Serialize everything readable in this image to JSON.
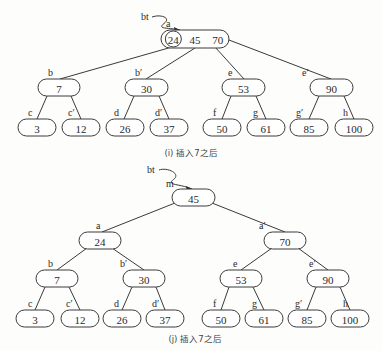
{
  "diagrams": [
    {
      "id": "i",
      "caption": "(i) 插入7之后",
      "pointer": {
        "label": "bt",
        "from": [
          152,
          17
        ],
        "to": [
          180,
          30
        ],
        "label_pos": [
          141,
          20
        ]
      },
      "nodes": [
        {
          "id": "a",
          "label": "a",
          "keys": "24  45  70",
          "x": 161,
          "y": 30,
          "w": 68,
          "h": 18,
          "lx": 166,
          "ly": 27,
          "circled_key": "24"
        },
        {
          "id": "b",
          "label": "b",
          "keys": "7",
          "x": 38,
          "y": 79,
          "w": 42,
          "h": 17,
          "lx": 48,
          "ly": 76
        },
        {
          "id": "b2",
          "label": "b′",
          "keys": "30",
          "x": 125,
          "y": 79,
          "w": 43,
          "h": 17,
          "lx": 135,
          "ly": 76
        },
        {
          "id": "e",
          "label": "e",
          "keys": "53",
          "x": 222,
          "y": 79,
          "w": 43,
          "h": 17,
          "lx": 228,
          "ly": 76
        },
        {
          "id": "e2",
          "label": "e′",
          "keys": "90",
          "x": 310,
          "y": 79,
          "w": 43,
          "h": 17,
          "lx": 302,
          "ly": 76
        },
        {
          "id": "c",
          "label": "c",
          "keys": "3",
          "x": 18,
          "y": 119,
          "w": 38,
          "h": 17,
          "lx": 28,
          "ly": 116
        },
        {
          "id": "c2",
          "label": "c′",
          "keys": "12",
          "x": 62,
          "y": 119,
          "w": 38,
          "h": 17,
          "lx": 68,
          "ly": 116
        },
        {
          "id": "d",
          "label": "d",
          "keys": "26",
          "x": 106,
          "y": 119,
          "w": 38,
          "h": 17,
          "lx": 114,
          "ly": 116
        },
        {
          "id": "d2",
          "label": "d′",
          "keys": "37",
          "x": 150,
          "y": 119,
          "w": 38,
          "h": 17,
          "lx": 155,
          "ly": 116
        },
        {
          "id": "f",
          "label": "f",
          "keys": "50",
          "x": 203,
          "y": 119,
          "w": 38,
          "h": 17,
          "lx": 213,
          "ly": 116
        },
        {
          "id": "g",
          "label": "g",
          "keys": "61",
          "x": 247,
          "y": 119,
          "w": 38,
          "h": 17,
          "lx": 253,
          "ly": 116
        },
        {
          "id": "g2",
          "label": "g′",
          "keys": "85",
          "x": 290,
          "y": 119,
          "w": 38,
          "h": 17,
          "lx": 296,
          "ly": 116
        },
        {
          "id": "h",
          "label": "h",
          "keys": "100",
          "x": 335,
          "y": 119,
          "w": 38,
          "h": 17,
          "lx": 343,
          "ly": 116
        }
      ],
      "edges": [
        [
          172,
          47,
          60,
          79
        ],
        [
          195,
          48,
          146,
          79
        ],
        [
          215,
          47,
          244,
          79
        ],
        [
          229,
          40,
          331,
          79
        ],
        [
          47,
          96,
          37,
          119
        ],
        [
          71,
          96,
          81,
          119
        ],
        [
          134,
          96,
          124,
          119
        ],
        [
          159,
          96,
          169,
          119
        ],
        [
          231,
          96,
          222,
          119
        ],
        [
          256,
          96,
          266,
          119
        ],
        [
          319,
          96,
          309,
          119
        ],
        [
          344,
          96,
          354,
          119
        ]
      ],
      "caption_pos": [
        191,
        156
      ]
    },
    {
      "id": "j",
      "caption": "(j) 插入7之后",
      "pointer": {
        "label": "bt",
        "from": [
          159,
          170
        ],
        "to": [
          192,
          189
        ],
        "label_pos": [
          147,
          173
        ]
      },
      "nodes": [
        {
          "id": "m",
          "label": "m",
          "keys": "45",
          "x": 172,
          "y": 189,
          "w": 43,
          "h": 17,
          "lx": 166,
          "ly": 187
        },
        {
          "id": "a",
          "label": "a",
          "keys": "24",
          "x": 79,
          "y": 232,
          "w": 42,
          "h": 17,
          "lx": 96,
          "ly": 229
        },
        {
          "id": "a2",
          "label": "a′",
          "keys": "70",
          "x": 264,
          "y": 232,
          "w": 42,
          "h": 17,
          "lx": 259,
          "ly": 229
        },
        {
          "id": "b",
          "label": "b",
          "keys": "7",
          "x": 36,
          "y": 270,
          "w": 42,
          "h": 17,
          "lx": 48,
          "ly": 267
        },
        {
          "id": "b2",
          "label": "b′",
          "keys": "30",
          "x": 123,
          "y": 270,
          "w": 42,
          "h": 17,
          "lx": 120,
          "ly": 267
        },
        {
          "id": "e",
          "label": "e",
          "keys": "53",
          "x": 220,
          "y": 270,
          "w": 42,
          "h": 17,
          "lx": 233,
          "ly": 267
        },
        {
          "id": "e2",
          "label": "e′",
          "keys": "90",
          "x": 307,
          "y": 270,
          "w": 42,
          "h": 17,
          "lx": 309,
          "ly": 267
        },
        {
          "id": "c",
          "label": "c",
          "keys": "3",
          "x": 16,
          "y": 310,
          "w": 38,
          "h": 17,
          "lx": 28,
          "ly": 307
        },
        {
          "id": "c2",
          "label": "c′",
          "keys": "12",
          "x": 61,
          "y": 310,
          "w": 38,
          "h": 17,
          "lx": 66,
          "ly": 307
        },
        {
          "id": "d",
          "label": "d",
          "keys": "26",
          "x": 103,
          "y": 310,
          "w": 38,
          "h": 17,
          "lx": 114,
          "ly": 307
        },
        {
          "id": "d2",
          "label": "d′",
          "keys": "37",
          "x": 146,
          "y": 310,
          "w": 38,
          "h": 17,
          "lx": 152,
          "ly": 307
        },
        {
          "id": "f",
          "label": "f",
          "keys": "50",
          "x": 202,
          "y": 310,
          "w": 38,
          "h": 17,
          "lx": 213,
          "ly": 307
        },
        {
          "id": "g",
          "label": "g",
          "keys": "61",
          "x": 245,
          "y": 310,
          "w": 38,
          "h": 17,
          "lx": 252,
          "ly": 307
        },
        {
          "id": "g2",
          "label": "g′",
          "keys": "85",
          "x": 288,
          "y": 310,
          "w": 38,
          "h": 17,
          "lx": 295,
          "ly": 307
        },
        {
          "id": "h",
          "label": "h",
          "keys": "100",
          "x": 331,
          "y": 310,
          "w": 38,
          "h": 17,
          "lx": 343,
          "ly": 307
        }
      ],
      "edges": [
        [
          175,
          203,
          102,
          232
        ],
        [
          212,
          203,
          285,
          232
        ],
        [
          87,
          248,
          57,
          270
        ],
        [
          112,
          248,
          144,
          270
        ],
        [
          272,
          248,
          241,
          270
        ],
        [
          298,
          248,
          328,
          270
        ],
        [
          45,
          287,
          35,
          310
        ],
        [
          69,
          287,
          80,
          310
        ],
        [
          132,
          287,
          122,
          310
        ],
        [
          156,
          287,
          165,
          310
        ],
        [
          229,
          287,
          221,
          310
        ],
        [
          253,
          287,
          264,
          310
        ],
        [
          316,
          287,
          307,
          310
        ],
        [
          340,
          287,
          350,
          310
        ]
      ],
      "caption_pos": [
        195,
        342
      ]
    }
  ]
}
